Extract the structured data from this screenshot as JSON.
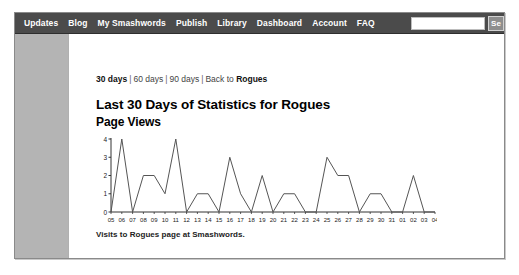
{
  "nav": {
    "items": [
      {
        "label": "Updates",
        "name": "nav-item-updates"
      },
      {
        "label": "Blog",
        "name": "nav-item-blog"
      },
      {
        "label": "My Smashwords",
        "name": "nav-item-my-smashwords"
      },
      {
        "label": "Publish",
        "name": "nav-item-publish"
      },
      {
        "label": "Library",
        "name": "nav-item-library"
      },
      {
        "label": "Dashboard",
        "name": "nav-item-dashboard"
      },
      {
        "label": "Account",
        "name": "nav-item-account"
      },
      {
        "label": "FAQ",
        "name": "nav-item-faq"
      }
    ],
    "search_value": "",
    "search_placeholder": "",
    "search_button_label": "Se",
    "bar_color": "#4b4b4b"
  },
  "ranges": {
    "current": "30 days",
    "option_60": "60 days",
    "option_90": "90 days",
    "back_prefix": "Back to ",
    "back_target": "Rogues",
    "separator": "|"
  },
  "main": {
    "title": "Last 30 Days of Statistics for Rogues",
    "subtitle": "Page Views",
    "caption": "Visits to Rogues page at Smashwords."
  },
  "chart_data": {
    "type": "line",
    "title": "Page Views",
    "xlabel": "",
    "ylabel": "",
    "ylim": [
      0,
      4
    ],
    "yticks": [
      0,
      1,
      2,
      3,
      4
    ],
    "grid": false,
    "legend": null,
    "line_color": "#555555",
    "axis_color": "#333333",
    "categories": [
      "05",
      "06",
      "07",
      "08",
      "09",
      "10",
      "11",
      "12",
      "13",
      "14",
      "15",
      "16",
      "17",
      "18",
      "19",
      "20",
      "21",
      "22",
      "23",
      "24",
      "25",
      "26",
      "27",
      "28",
      "29",
      "30",
      "31",
      "01",
      "02",
      "03",
      "04"
    ],
    "values": [
      0,
      4,
      0,
      2,
      2,
      1,
      4,
      0,
      1,
      1,
      0,
      3,
      1,
      0,
      2,
      0,
      1,
      1,
      0,
      0,
      3,
      2,
      2,
      0,
      1,
      1,
      0,
      0,
      2,
      0,
      0
    ],
    "series": [
      {
        "name": "Page Views",
        "values": [
          0,
          4,
          0,
          2,
          2,
          1,
          4,
          0,
          1,
          1,
          0,
          3,
          1,
          0,
          2,
          0,
          1,
          1,
          0,
          0,
          3,
          2,
          2,
          0,
          1,
          1,
          0,
          0,
          2,
          0,
          0
        ]
      }
    ]
  }
}
